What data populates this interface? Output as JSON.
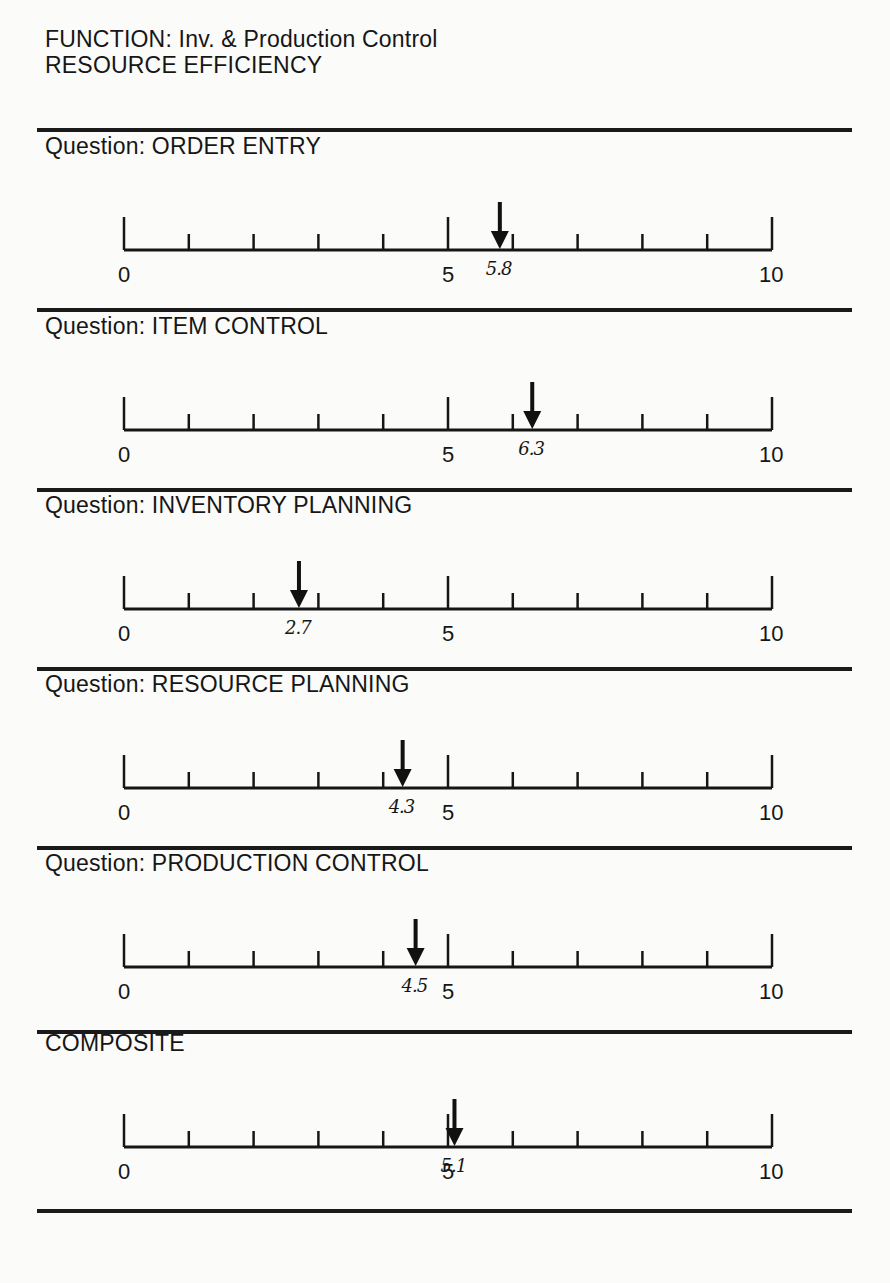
{
  "header": {
    "line1": "FUNCTION: Inv. & Production Control",
    "line2": "RESOURCE EFFICIENCY"
  },
  "scale": {
    "min": 0,
    "mid": 5,
    "max": 10,
    "min_label": "0",
    "mid_label": "5",
    "max_label": "10"
  },
  "sections": [
    {
      "label": "Question: ORDER ENTRY",
      "value": 5.8,
      "value_label": "5.8"
    },
    {
      "label": "Question: ITEM CONTROL",
      "value": 6.3,
      "value_label": "6.3"
    },
    {
      "label": "Question: INVENTORY PLANNING",
      "value": 2.7,
      "value_label": "2.7"
    },
    {
      "label": "Question: RESOURCE PLANNING",
      "value": 4.3,
      "value_label": "4.3"
    },
    {
      "label": "Question: PRODUCTION CONTROL",
      "value": 4.5,
      "value_label": "4.5"
    },
    {
      "label": "COMPOSITE",
      "value": 5.1,
      "value_label": "5.1"
    }
  ],
  "chart_data": {
    "type": "bar",
    "categories": [
      "ORDER ENTRY",
      "ITEM CONTROL",
      "INVENTORY PLANNING",
      "RESOURCE PLANNING",
      "PRODUCTION CONTROL",
      "COMPOSITE"
    ],
    "values": [
      5.8,
      6.3,
      2.7,
      4.3,
      4.5,
      5.1
    ],
    "xlabel": "",
    "ylabel": "",
    "xlim": [
      0,
      10
    ],
    "ticks": [
      0,
      1,
      2,
      3,
      4,
      5,
      6,
      7,
      8,
      9,
      10
    ],
    "tick_labels": [
      "0",
      "5",
      "10"
    ],
    "marker": "down-arrow",
    "grid": false,
    "legend": "none"
  }
}
